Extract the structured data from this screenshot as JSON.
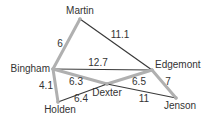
{
  "graph": {
    "nodes": [
      {
        "id": "Martin",
        "label": "Martin",
        "x": 80,
        "y": 19,
        "lx": 80,
        "ly": 14,
        "anchor": "middle"
      },
      {
        "id": "Bingham",
        "label": "Bingham",
        "x": 53,
        "y": 69,
        "lx": 50,
        "ly": 72,
        "anchor": "end"
      },
      {
        "id": "Edgemont",
        "label": "Edgemont",
        "x": 152,
        "y": 70,
        "lx": 155,
        "ly": 68,
        "anchor": "start"
      },
      {
        "id": "Dexter",
        "label": "Dexter",
        "x": 107,
        "y": 84,
        "lx": 107,
        "ly": 96,
        "anchor": "middle"
      },
      {
        "id": "Holden",
        "label": "Holden",
        "x": 58,
        "y": 102,
        "lx": 60,
        "ly": 113,
        "anchor": "middle"
      },
      {
        "id": "Jenson",
        "label": "Jenson",
        "x": 176,
        "y": 98,
        "lx": 180,
        "ly": 109,
        "anchor": "middle"
      }
    ],
    "edges": [
      {
        "from": "Martin",
        "to": "Bingham",
        "weight": "6",
        "highlight": true,
        "lx": 60,
        "ly": 47
      },
      {
        "from": "Martin",
        "to": "Edgemont",
        "weight": "11.1",
        "highlight": false,
        "lx": 120,
        "ly": 38
      },
      {
        "from": "Bingham",
        "to": "Edgemont",
        "weight": "12.7",
        "highlight": false,
        "lx": 98,
        "ly": 66
      },
      {
        "from": "Bingham",
        "to": "Dexter",
        "weight": "6.3",
        "highlight": true,
        "lx": 76,
        "ly": 85
      },
      {
        "from": "Bingham",
        "to": "Holden",
        "weight": "4.1",
        "highlight": true,
        "lx": 46,
        "ly": 89
      },
      {
        "from": "Holden",
        "to": "Dexter",
        "weight": "6.4",
        "highlight": false,
        "lx": 81,
        "ly": 102
      },
      {
        "from": "Dexter",
        "to": "Edgemont",
        "weight": "6.5",
        "highlight": true,
        "lx": 139,
        "ly": 85
      },
      {
        "from": "Dexter",
        "to": "Jenson",
        "weight": "11",
        "highlight": false,
        "lx": 144,
        "ly": 102
      },
      {
        "from": "Edgemont",
        "to": "Jenson",
        "weight": "7",
        "highlight": true,
        "lx": 168,
        "ly": 85
      }
    ],
    "colors": {
      "highlight_edge": "#b0b0b0",
      "normal_edge": "#3a3a3a",
      "label": "#333333"
    }
  }
}
